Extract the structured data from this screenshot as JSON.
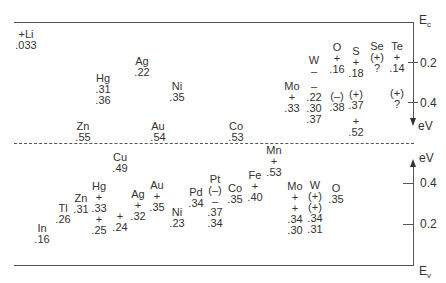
{
  "diagram": {
    "type": "impurity-energy-levels",
    "axes": {
      "top_label": "Ec",
      "bottom_label": "Ev",
      "upper_unit": "eV",
      "lower_unit": "eV",
      "upper_ticks": [
        "0.2",
        "0.4"
      ],
      "lower_ticks": [
        "0.4",
        "0.2"
      ]
    },
    "conduction_side": [
      {
        "id": "li",
        "lines": [
          "+Li",
          ".033"
        ]
      },
      {
        "id": "hg",
        "lines": [
          "Hg",
          ".31",
          ".36"
        ]
      },
      {
        "id": "ag",
        "lines": [
          "Ag",
          ".22"
        ]
      },
      {
        "id": "ni",
        "lines": [
          "Ni",
          ".35"
        ]
      },
      {
        "id": "zn",
        "lines": [
          "Zn",
          ".55"
        ]
      },
      {
        "id": "au",
        "lines": [
          "Au",
          ".54"
        ]
      },
      {
        "id": "co",
        "lines": [
          "Co",
          ".53"
        ]
      },
      {
        "id": "mo",
        "lines": [
          "Mo",
          "+",
          ".33"
        ]
      },
      {
        "id": "w",
        "lines": [
          "W",
          "–",
          "",
          "–",
          ".22",
          ".30",
          ".37"
        ]
      },
      {
        "id": "o",
        "lines": [
          "O",
          "+",
          ".16",
          "",
          "(–)",
          ".38"
        ]
      },
      {
        "id": "s",
        "lines": [
          "S",
          "+",
          ".18",
          "",
          "(+)",
          ".37",
          "",
          "+",
          ".52"
        ]
      },
      {
        "id": "se",
        "lines": [
          "Se",
          "(+)",
          "?"
        ]
      },
      {
        "id": "te",
        "lines": [
          "Te",
          "+",
          ".14",
          "",
          "(+)",
          "?"
        ]
      }
    ],
    "valence_side": [
      {
        "id": "cu",
        "lines": [
          "Cu",
          ".49"
        ]
      },
      {
        "id": "mn",
        "lines": [
          "Mn",
          "+",
          ".53"
        ]
      },
      {
        "id": "in",
        "lines": [
          "In",
          ".16"
        ]
      },
      {
        "id": "tl",
        "lines": [
          "Tl",
          ".26"
        ]
      },
      {
        "id": "zn",
        "lines": [
          "Zn",
          ".31"
        ]
      },
      {
        "id": "hg",
        "lines": [
          "Hg",
          "+",
          ".33",
          "+",
          ".25"
        ]
      },
      {
        "id": "plus24",
        "lines": [
          "+",
          ".24"
        ]
      },
      {
        "id": "ag",
        "lines": [
          "Ag",
          "+",
          ".32"
        ]
      },
      {
        "id": "au",
        "lines": [
          "Au",
          "+",
          ".35"
        ]
      },
      {
        "id": "ni",
        "lines": [
          "Ni",
          ".23"
        ]
      },
      {
        "id": "pd",
        "lines": [
          "Pd",
          ".34"
        ]
      },
      {
        "id": "pt",
        "lines": [
          "Pt",
          "(–)",
          "–",
          ".37",
          ".34"
        ]
      },
      {
        "id": "co",
        "lines": [
          "Co",
          ".35"
        ]
      },
      {
        "id": "fe",
        "lines": [
          "Fe",
          "+",
          ".40"
        ]
      },
      {
        "id": "mo",
        "lines": [
          "Mo",
          "+",
          "+",
          ".34",
          ".30"
        ]
      },
      {
        "id": "w",
        "lines": [
          "W",
          "(+)",
          "(+)",
          ".34",
          ".31"
        ]
      },
      {
        "id": "o",
        "lines": [
          "O",
          ".35"
        ]
      }
    ]
  }
}
